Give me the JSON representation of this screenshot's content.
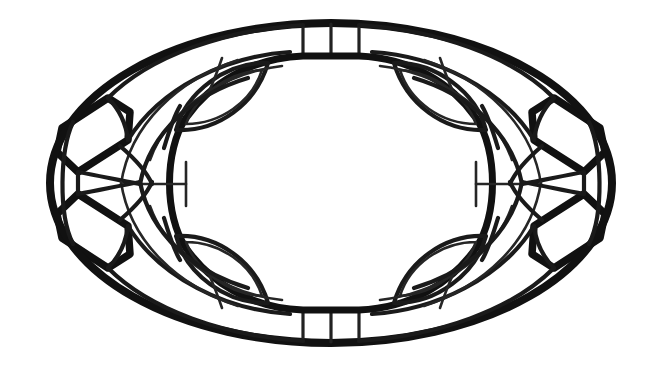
{
  "document": {
    "kind": "line-art-illustration",
    "subject": "oval woven basket viewed from above",
    "style": "black ink outline coloring page",
    "canvas_width": 662,
    "canvas_height": 378,
    "background_color": "#ffffff",
    "ink_color": "#111111",
    "has_text": false,
    "has_color_fill": false
  },
  "palette": {
    "background": "#ffffff",
    "outline_heavy": "#111111",
    "outline_medium": "#1a1a1a",
    "outline_light": "#262626"
  },
  "geometry": {
    "outer_ellipse": {
      "center_x": 331,
      "center_y": 183,
      "radius_x": 281,
      "radius_y": 160
    },
    "inner_opening": {
      "center_x": 331,
      "center_y": 183,
      "radius_x": 131,
      "radius_y": 79
    }
  },
  "parts": {
    "outer_rim_label": "outer rim",
    "inner_opening_label": "inner opening",
    "handle_label": "corner handle tab",
    "rim_tab_label": "rim segment tab",
    "leaf_label": "woven leaf panel",
    "band_label": "woven band"
  },
  "handles": [
    {
      "id": "upper-left",
      "cx": 96,
      "cy": 120
    },
    {
      "id": "lower-left",
      "cx": 96,
      "cy": 246
    },
    {
      "id": "upper-right",
      "cx": 566,
      "cy": 120
    },
    {
      "id": "lower-right",
      "cx": 566,
      "cy": 246
    }
  ],
  "rim_tabs": [
    {
      "id": "top-left-tab",
      "x": 303,
      "y": 26,
      "w": 28,
      "h": 28
    },
    {
      "id": "top-right-tab",
      "x": 331,
      "y": 26,
      "w": 28,
      "h": 28
    },
    {
      "id": "bottom-left-tab",
      "x": 303,
      "y": 310,
      "w": 28,
      "h": 28
    },
    {
      "id": "bottom-right-tab",
      "x": 331,
      "y": 310,
      "w": 28,
      "h": 28
    }
  ],
  "leaf_panels": [
    {
      "id": "leaf-upper-left",
      "tip_a_x": 178,
      "tip_a_y": 128,
      "tip_b_x": 268,
      "tip_b_y": 64
    },
    {
      "id": "leaf-upper-right",
      "tip_a_x": 484,
      "tip_a_y": 128,
      "tip_b_x": 394,
      "tip_b_y": 64
    },
    {
      "id": "leaf-lower-left",
      "tip_a_x": 178,
      "tip_a_y": 238,
      "tip_b_x": 268,
      "tip_b_y": 302
    },
    {
      "id": "leaf-lower-right",
      "tip_a_x": 484,
      "tip_a_y": 238,
      "tip_b_x": 394,
      "tip_b_y": 302
    }
  ],
  "counts": {
    "handles": 4,
    "rim_tabs": 4,
    "leaf_panels": 4,
    "quadrants": 4
  }
}
